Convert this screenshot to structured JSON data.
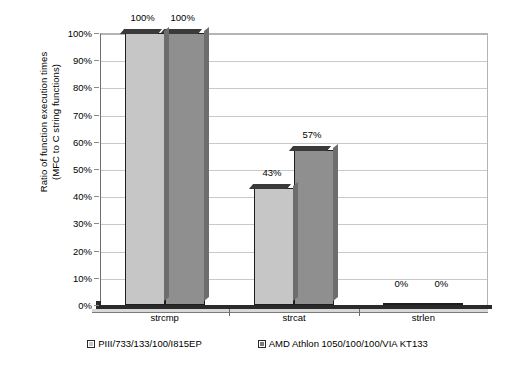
{
  "chart_data": {
    "type": "bar",
    "title": "",
    "subtitle": "",
    "xlabel": "",
    "ylabel": "Ratio of function execution times (MFC to C string functions)",
    "ylabel_lines": [
      "Ratio of function execution times",
      "(MFC to C string functions)"
    ],
    "categories": [
      "strcmp",
      "strcat",
      "strlen"
    ],
    "series": [
      {
        "name": "PIII/733/133/100/I815EP",
        "values": [
          100,
          43,
          0
        ],
        "labels": [
          "100%",
          "43%",
          "0%"
        ],
        "color": "#c6c6c6"
      },
      {
        "name": "AMD Athlon 1050/100/100/VIA KT133",
        "values": [
          100,
          57,
          0
        ],
        "labels": [
          "100%",
          "57%",
          "0%"
        ],
        "color": "#8f8f8f"
      }
    ],
    "ylim": [
      0,
      100
    ],
    "ytick_values": [
      0,
      10,
      20,
      30,
      40,
      50,
      60,
      70,
      80,
      90,
      100
    ],
    "ytick_labels": [
      "0%",
      "10%",
      "20%",
      "30%",
      "40%",
      "50%",
      "60%",
      "70%",
      "80%",
      "90%",
      "100%"
    ],
    "grid": true,
    "grid_axis": "y",
    "legend_position": "bottom",
    "value_suffix": "%"
  },
  "legend": {
    "items": [
      {
        "label": "PIII/733/133/100/I815EP",
        "swatch_name": "legend-swatch-piii"
      },
      {
        "label": "AMD Athlon 1050/100/100/VIA KT133",
        "swatch_name": "legend-swatch-amd"
      }
    ]
  }
}
